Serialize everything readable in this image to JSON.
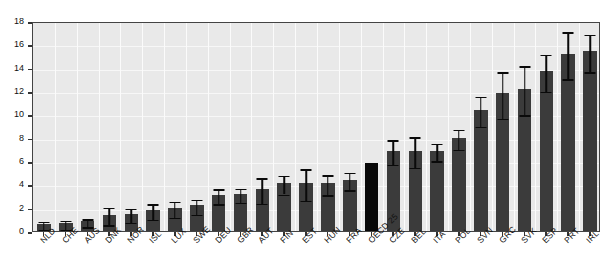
{
  "chart_data": {
    "type": "bar",
    "title": "",
    "subtitle": "",
    "xlabel": "",
    "ylabel": "",
    "ylim": [
      0,
      18
    ],
    "ytick_step": 2,
    "yticks": [
      0,
      2,
      4,
      6,
      8,
      10,
      12,
      14,
      16,
      18
    ],
    "grid": true,
    "legend": "none",
    "orientation": "vertical",
    "sorted": "ascending",
    "error_bars": "symmetric-vertical-with-caps",
    "bar_color": "#3b3b3b",
    "highlight_color": "#080808",
    "highlight_category": "OECD 25",
    "plot_background": "#e9e9e9",
    "gridline_color": "#f8f8f8",
    "axis_color": "#444444",
    "categories": [
      "NLD",
      "CHE",
      "AUS",
      "DNK",
      "NOR",
      "ISL",
      "LUX",
      "SWE",
      "DEU",
      "GBR",
      "AUT",
      "FIN",
      "EST",
      "HUN",
      "FRA",
      "OECD 25",
      "CZE",
      "BEL",
      "ITA",
      "POL",
      "SVN",
      "GRC",
      "SVK",
      "ESP",
      "PRT",
      "IRL"
    ],
    "values": [
      0.6,
      0.65,
      0.85,
      1.4,
      1.5,
      1.8,
      2.0,
      2.2,
      3.1,
      3.2,
      3.6,
      4.1,
      4.1,
      4.1,
      4.4,
      5.8,
      6.9,
      6.9,
      6.9,
      8.0,
      10.4,
      11.8,
      12.2,
      13.7,
      15.2,
      15.4
    ],
    "err_low": [
      0.35,
      0.4,
      0.35,
      0.75,
      0.6,
      0.65,
      0.7,
      0.65,
      0.65,
      0.6,
      1.1,
      0.8,
      1.35,
      0.85,
      0.75,
      0.0,
      1.05,
      1.3,
      0.75,
      0.85,
      1.3,
      2.0,
      2.1,
      1.6,
      2.0,
      1.6
    ],
    "err_high": [
      0.35,
      0.4,
      0.35,
      0.75,
      0.6,
      0.65,
      0.7,
      0.65,
      0.65,
      0.6,
      1.1,
      0.8,
      1.35,
      0.85,
      0.75,
      0.0,
      1.05,
      1.3,
      0.75,
      0.85,
      1.3,
      2.0,
      2.1,
      1.6,
      2.0,
      1.6
    ]
  }
}
